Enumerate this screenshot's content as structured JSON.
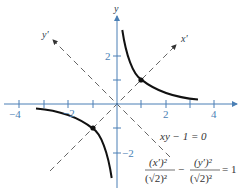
{
  "figure": {
    "axes": {
      "x_label": "x",
      "y_label": "y",
      "rotated_x_label": "x′",
      "rotated_y_label": "y′",
      "x_ticks": [
        "−4",
        "−2",
        "2",
        "4"
      ],
      "y_ticks": [
        "2",
        "−2"
      ],
      "axis_color": "#4a7fb5"
    },
    "curve": {
      "color": "#111111",
      "equation": "xy − 1 = 0"
    },
    "rotated_equation": {
      "num1": "(x′)²",
      "den1": "(√2)²",
      "minus": "−",
      "num2": "(y′)²",
      "den2": "(√2)²",
      "rhs": "= 1"
    },
    "vertices": [
      [
        1,
        1
      ],
      [
        -1,
        -1
      ]
    ]
  }
}
